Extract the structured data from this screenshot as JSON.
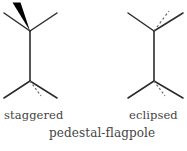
{
  "figure": {
    "title_caption": "pedestal-flagpole",
    "left_label": "staggered",
    "right_label": "eclipsed",
    "bond_color": "#2b2b2b",
    "wedge_color": "#000000",
    "dash_color": "#6b6b6b",
    "text_color": "#444444",
    "background": "#ffffff"
  },
  "structures": [
    {
      "name": "staggered",
      "label": "staggered",
      "top_center": {
        "x": 30,
        "y": 31
      },
      "bottom_center": {
        "x": 30,
        "y": 81
      },
      "top_bonds": [
        {
          "kind": "wedge",
          "to": {
            "x": 16,
            "y": 4
          },
          "width": 7
        },
        {
          "kind": "plain",
          "to": {
            "x": 4,
            "y": 13
          }
        },
        {
          "kind": "plain",
          "to": {
            "x": 57,
            "y": 13
          }
        }
      ],
      "bottom_bonds": [
        {
          "kind": "plain",
          "to": {
            "x": 4,
            "y": 98
          }
        },
        {
          "kind": "plain",
          "to": {
            "x": 57,
            "y": 98
          }
        },
        {
          "kind": "dashed",
          "to": {
            "x": 41,
            "y": 96
          }
        }
      ]
    },
    {
      "name": "eclipsed",
      "label": "eclipsed",
      "top_center": {
        "x": 154,
        "y": 31
      },
      "bottom_center": {
        "x": 154,
        "y": 81
      },
      "top_bonds": [
        {
          "kind": "plain",
          "to": {
            "x": 128,
            "y": 13
          }
        },
        {
          "kind": "plain",
          "to": {
            "x": 182,
            "y": 13
          }
        },
        {
          "kind": "dashed",
          "to": {
            "x": 169,
            "y": 12
          }
        }
      ],
      "bottom_bonds": [
        {
          "kind": "plain",
          "to": {
            "x": 128,
            "y": 98
          }
        },
        {
          "kind": "plain",
          "to": {
            "x": 182,
            "y": 98
          }
        },
        {
          "kind": "dashed",
          "to": {
            "x": 165,
            "y": 96
          }
        }
      ]
    }
  ]
}
